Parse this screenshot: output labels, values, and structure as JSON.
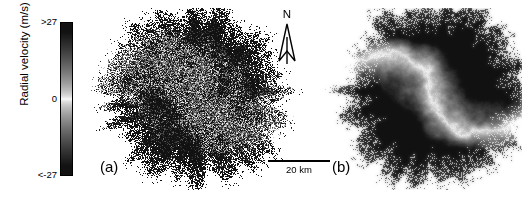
{
  "figure": {
    "type": "two-panel radar radial velocity map",
    "background_color": "#ffffff"
  },
  "colorbar": {
    "axis_label": "Radial velocity (m/s)",
    "tick_top": ">27",
    "tick_mid": "0",
    "tick_bottom": "<-27",
    "orientation": "vertical",
    "high_color": "#1a1a1a",
    "zero_color": "#ffffff",
    "low_color": "#1a1a1a",
    "border_color": "#000000"
  },
  "panels": [
    {
      "id": "a",
      "label": "(a)",
      "style": "noisy speckled dipole"
    },
    {
      "id": "b",
      "label": "(b)",
      "style": "smooth dipole with sharp zero line"
    }
  ],
  "north_arrow": {
    "label": "N",
    "icon": "north-arrow-icon"
  },
  "scale_bar": {
    "label": "20 km",
    "length_km": 20
  },
  "chart_data": {
    "type": "heatmap",
    "title": "",
    "xlabel": "",
    "ylabel": "",
    "colorbar_label": "Radial velocity (m/s)",
    "colorbar_ticks": [
      ">27",
      "0",
      "<-27"
    ],
    "vmin": -27,
    "vmax": 27,
    "colormap": "dark-white-dark (diverging grayscale)",
    "grid": false,
    "legend_position": "left (vertical colorbar)",
    "scale_bar_km": 20,
    "north_label": "N",
    "panels": [
      {
        "id": "a",
        "label": "(a)",
        "noise_amplitude": 26,
        "speckle": 0.52,
        "smoothing": 0.0,
        "radius_px": 88,
        "center": [
          110,
          86
        ],
        "lobes": [
          {
            "name": "approaching-lobe",
            "quadrant": "upper-right",
            "sign": "negative",
            "peak_value": -27
          },
          {
            "name": "receding-lobe",
            "quadrant": "lower-left",
            "sign": "positive",
            "peak_value": 27
          }
        ],
        "zero_line": "S-shaped curve running NW-SE through center"
      },
      {
        "id": "b",
        "label": "(b)",
        "noise_amplitude": 7,
        "speckle": 0.18,
        "smoothing": 0.85,
        "radius_px": 90,
        "center": [
          112,
          86
        ],
        "lobes": [
          {
            "name": "approaching-lobe",
            "quadrant": "upper-right",
            "sign": "negative",
            "peak_value": -27
          },
          {
            "name": "receding-lobe",
            "quadrant": "lower-left",
            "sign": "positive",
            "peak_value": 27
          }
        ],
        "zero_line": "S-shaped curve running NW-SE through center"
      }
    ]
  }
}
